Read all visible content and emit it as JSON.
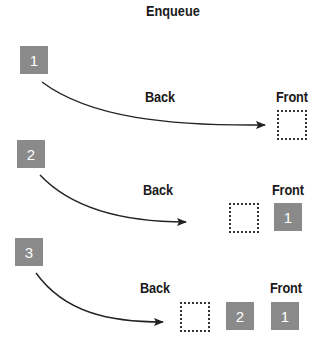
{
  "title": "Enqueue",
  "colors": {
    "item_fill": "#8a8a8a",
    "item_text": "#ffffff",
    "line": "#222222"
  },
  "steps": [
    {
      "incoming": "1",
      "back_label": "Back",
      "front_label": "Front",
      "queue": []
    },
    {
      "incoming": "2",
      "back_label": "Back",
      "front_label": "Front",
      "queue": [
        "1"
      ]
    },
    {
      "incoming": "3",
      "back_label": "Back",
      "front_label": "Front",
      "queue": [
        "2",
        "1"
      ]
    }
  ]
}
